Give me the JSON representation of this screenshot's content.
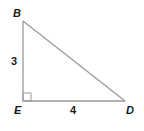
{
  "figure": {
    "type": "right-triangle",
    "vertices": [
      {
        "name": "B",
        "x": 23,
        "y": 21
      },
      {
        "name": "E",
        "x": 23,
        "y": 101
      },
      {
        "name": "D",
        "x": 125,
        "y": 101
      }
    ],
    "right_angle_at": "E",
    "sides": [
      {
        "from": "B",
        "to": "E",
        "length_label": "3"
      },
      {
        "from": "E",
        "to": "D",
        "length_label": "4"
      },
      {
        "from": "B",
        "to": "D",
        "length_label": ""
      }
    ],
    "line_color": "#9a9a9a",
    "label_color": "#1a1a1a"
  },
  "labels": {
    "B": "B",
    "E": "E",
    "D": "D",
    "side_BE": "3",
    "side_ED": "4"
  }
}
